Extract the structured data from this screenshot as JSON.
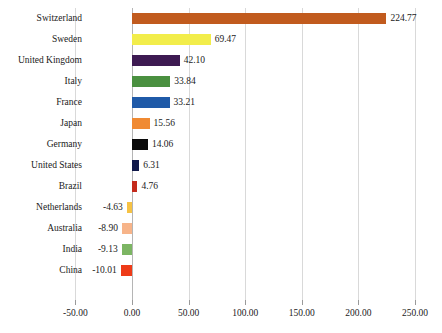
{
  "chart_data": {
    "type": "bar",
    "orientation": "horizontal",
    "title": "",
    "subtitle": "",
    "xlabel": "",
    "ylabel": "",
    "xlim": [
      -50.0,
      250.0
    ],
    "xticks": [
      "-50.00",
      "0.00",
      "50.00",
      "100.00",
      "150.00",
      "200.00",
      "250.00"
    ],
    "xtick_values": [
      -50,
      0,
      50,
      100,
      150,
      200,
      250
    ],
    "grid": "vertical",
    "legend": "none",
    "categories": [
      "Switzerland",
      "Sweden",
      "United Kingdom",
      "Italy",
      "France",
      "Japan",
      "Germany",
      "United States",
      "Brazil",
      "Netherlands",
      "Australia",
      "India",
      "China"
    ],
    "values": [
      224.77,
      69.47,
      42.1,
      33.84,
      33.21,
      15.56,
      14.06,
      6.31,
      4.76,
      -4.63,
      -8.9,
      -9.13,
      -10.01
    ],
    "value_labels": [
      "224.77",
      "69.47",
      "42.10",
      "33.84",
      "33.21",
      "15.56",
      "14.06",
      "6.31",
      "4.76",
      "-4.63",
      "-8.90",
      "-9.13",
      "-10.01"
    ],
    "bar_colors": [
      "#c15b1e",
      "#f2ed4b",
      "#3d1a52",
      "#4a9040",
      "#1f5aa8",
      "#f08a33",
      "#0a0a0a",
      "#10184a",
      "#c42a1c",
      "#f6c244",
      "#f7b489",
      "#7cb563",
      "#ee3b18"
    ],
    "axis_color": "#d9d9d9",
    "zero_line_color": "#b5b5b5",
    "background_color": "#ffffff",
    "text_color": "#1a1a1a"
  }
}
